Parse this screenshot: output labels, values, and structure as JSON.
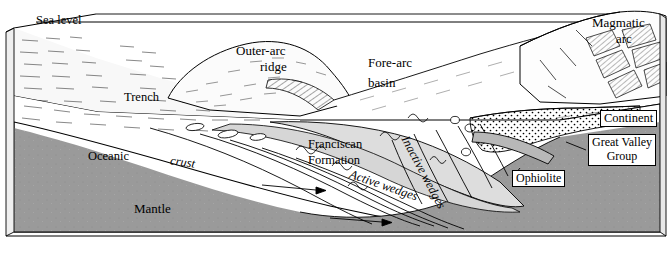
{
  "figure": {
    "colors": {
      "line": "#000000",
      "background": "#ffffff",
      "mantle_fill": "#9a9a9a",
      "mantle_side_fill": "#8c8c8c",
      "wedge_fill": "#d9d9d9",
      "forearc_fill": "#f2f2f2",
      "ophiolite_fill": "#cccccc"
    }
  },
  "labels": {
    "sea_level": "Sea level",
    "outer_arc_ridge": "Outer-arc\nridge",
    "outer_arc_ridge_line1": "Outer-arc",
    "outer_arc_ridge_line2": "ridge",
    "fore_arc_basin_line1": "Fore-arc",
    "fore_arc_basin_line2": "basin",
    "magmatic_arc_line1": "Magmatic",
    "magmatic_arc_line2": "arc",
    "trench": "Trench",
    "continent": "Continent",
    "oceanic": "Oceanic",
    "crust": "crust",
    "mantle": "Mantle",
    "franciscan_line1": "Franciscan",
    "franciscan_line2": "Formation",
    "active_wedges": "Active wedges",
    "inactive_wedges": "Inactive wedges",
    "great_valley_line1": "Great Valley",
    "great_valley_line2": "Group",
    "ophiolite": "Ophiolite"
  }
}
